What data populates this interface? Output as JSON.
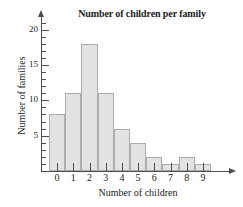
{
  "chart_data": {
    "type": "bar",
    "title": "Number of children per family",
    "xlabel": "Number of children",
    "ylabel": "Number of families",
    "categories": [
      "0",
      "1",
      "2",
      "3",
      "4",
      "5",
      "6",
      "7",
      "8",
      "9"
    ],
    "values": [
      8,
      11,
      18,
      11,
      6,
      4,
      2,
      1,
      2,
      1
    ],
    "xlim": [
      -0.5,
      9.5
    ],
    "ylim": [
      0,
      21
    ],
    "ytick_major": [
      5,
      10,
      15,
      20
    ],
    "ytick_major_labels": [
      "5",
      "10",
      "15",
      "20"
    ],
    "ytick_minor": [
      1,
      2,
      3,
      4,
      6,
      7,
      8,
      9,
      11,
      12,
      13,
      14,
      16,
      17,
      18,
      19,
      20,
      21
    ],
    "grid": false,
    "legend": null,
    "bar_fill_color": "#e2e2e2",
    "bar_edge_color": "#adadad",
    "axis_color": "#4d4d4d",
    "text_color": "#1a1a1a",
    "background_color": "#ffffff"
  }
}
